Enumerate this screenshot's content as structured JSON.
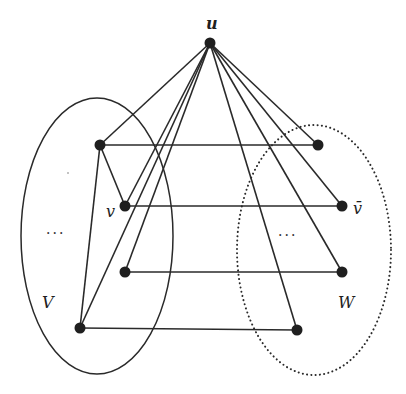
{
  "diagram": {
    "type": "graph",
    "labels": {
      "apex": "u",
      "left_set": "V",
      "right_set": "W",
      "v_node": "v",
      "v_bar_node": "v̄",
      "left_ellipsis": "···",
      "right_ellipsis": "···"
    },
    "nodes": [
      {
        "id": "u",
        "label": "u",
        "x": 210,
        "y": 43
      },
      {
        "id": "L1",
        "label": "",
        "x": 100,
        "y": 145
      },
      {
        "id": "L2",
        "label": "v",
        "x": 125,
        "y": 206
      },
      {
        "id": "L3",
        "label": "",
        "x": 125,
        "y": 272
      },
      {
        "id": "L4",
        "label": "",
        "x": 80,
        "y": 328
      },
      {
        "id": "R1",
        "label": "",
        "x": 318,
        "y": 145
      },
      {
        "id": "R2",
        "label": "v̄",
        "x": 342,
        "y": 206
      },
      {
        "id": "R3",
        "label": "",
        "x": 342,
        "y": 272
      },
      {
        "id": "R4",
        "label": "",
        "x": 297,
        "y": 330
      }
    ],
    "edges": [
      [
        "u",
        "L1"
      ],
      [
        "u",
        "L2"
      ],
      [
        "u",
        "L3"
      ],
      [
        "u",
        "L4"
      ],
      [
        "u",
        "R1"
      ],
      [
        "u",
        "R2"
      ],
      [
        "u",
        "R3"
      ],
      [
        "u",
        "R4"
      ],
      [
        "L1",
        "R1"
      ],
      [
        "L2",
        "R2"
      ],
      [
        "L3",
        "R3"
      ],
      [
        "L4",
        "R4"
      ],
      [
        "L1",
        "L2"
      ],
      [
        "L1",
        "L4"
      ]
    ],
    "sets": [
      {
        "name": "V",
        "style": "solid",
        "cx": 97,
        "cy": 236,
        "rx": 76,
        "ry": 138
      },
      {
        "name": "W",
        "style": "dotted",
        "cx": 314,
        "cy": 250,
        "rx": 77,
        "ry": 125
      }
    ]
  }
}
